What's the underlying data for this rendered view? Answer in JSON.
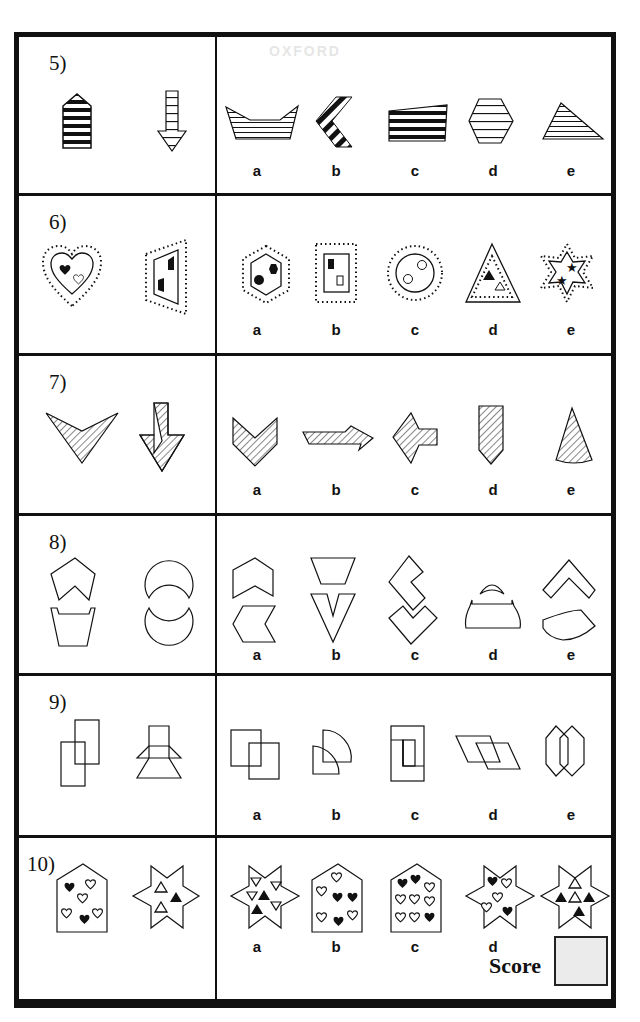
{
  "document": {
    "title": "Non-verbal reasoning: Odd one out / Which shape belongs with the two given",
    "watermark": "OXFORD"
  },
  "questions": [
    {
      "number": "5)",
      "given": [
        "striped house-shaped pentagon (thick black stripes)",
        "striped down arrow (thin stripes)"
      ],
      "options": [
        {
          "label": "a",
          "shape": "boat trapezoid with horizontal thin stripes"
        },
        {
          "label": "b",
          "shape": "chevron with thick black diagonal stripes"
        },
        {
          "label": "c",
          "shape": "quadrilateral with thick black horizontal stripes"
        },
        {
          "label": "d",
          "shape": "hexagon with horizontal stripes"
        },
        {
          "label": "e",
          "shape": "right triangle with thin horizontal stripes"
        }
      ]
    },
    {
      "number": "6)",
      "given": [
        "heart in dotted heart with filled and empty heart",
        "trapezoid in dotted trapezoid with two filled shapes"
      ],
      "options": [
        {
          "label": "a",
          "shape": "hexagon in dotted hexagon with two filled hexagons"
        },
        {
          "label": "b",
          "shape": "rectangle in dotted rectangle with filled and empty squares"
        },
        {
          "label": "c",
          "shape": "circle in dotted circle with two empty circles"
        },
        {
          "label": "d",
          "shape": "triangle with dotted triangle inside, filled and empty triangles"
        },
        {
          "label": "e",
          "shape": "star in dotted star with two filled stars"
        }
      ]
    },
    {
      "number": "7)",
      "given": [
        "hatched arrowhead",
        "hatched down arrow"
      ],
      "options": [
        {
          "label": "a",
          "shape": "hatched chevron"
        },
        {
          "label": "b",
          "shape": "hatched right arrow"
        },
        {
          "label": "c",
          "shape": "hatched left arrow"
        },
        {
          "label": "d",
          "shape": "hatched pencil shape"
        },
        {
          "label": "e",
          "shape": "hatched cone"
        }
      ]
    },
    {
      "number": "8)",
      "given": [
        "split pentagon pieces",
        "split circle pieces"
      ],
      "options": [
        {
          "label": "a",
          "shape": "pentagon piece and chevron piece"
        },
        {
          "label": "b",
          "shape": "trapezoid and V shape"
        },
        {
          "label": "c",
          "shape": "two L-shaped diamond pieces"
        },
        {
          "label": "d",
          "shape": "arc and dome"
        },
        {
          "label": "e",
          "shape": "chevron and curved band"
        }
      ]
    },
    {
      "number": "9)",
      "given": [
        "two overlapping rectangles",
        "two overlapping trapezoid frames"
      ],
      "options": [
        {
          "label": "a",
          "shape": "two overlapping squares"
        },
        {
          "label": "b",
          "shape": "two overlapping quarter circles"
        },
        {
          "label": "c",
          "shape": "rectangle with inner rectangle"
        },
        {
          "label": "d",
          "shape": "two overlapping parallelograms"
        },
        {
          "label": "e",
          "shape": "two overlapping hexagons"
        }
      ]
    },
    {
      "number": "10)",
      "given": [
        "house with 2 filled and 4 empty hearts",
        "star with 2 empty and 1 filled triangle"
      ],
      "options": [
        {
          "label": "a",
          "shape": "star with 4 empty and 2 filled triangles"
        },
        {
          "label": "b",
          "shape": "house with 3 filled and 4 empty hearts"
        },
        {
          "label": "c",
          "shape": "house with 3 filled and 7 empty hearts"
        },
        {
          "label": "d",
          "shape": "star with 2 filled and 3 empty hearts"
        },
        {
          "label": "e",
          "shape": "star with 2 empty and 3 filled triangles"
        }
      ]
    }
  ],
  "score": {
    "label": "Score",
    "value": ""
  }
}
